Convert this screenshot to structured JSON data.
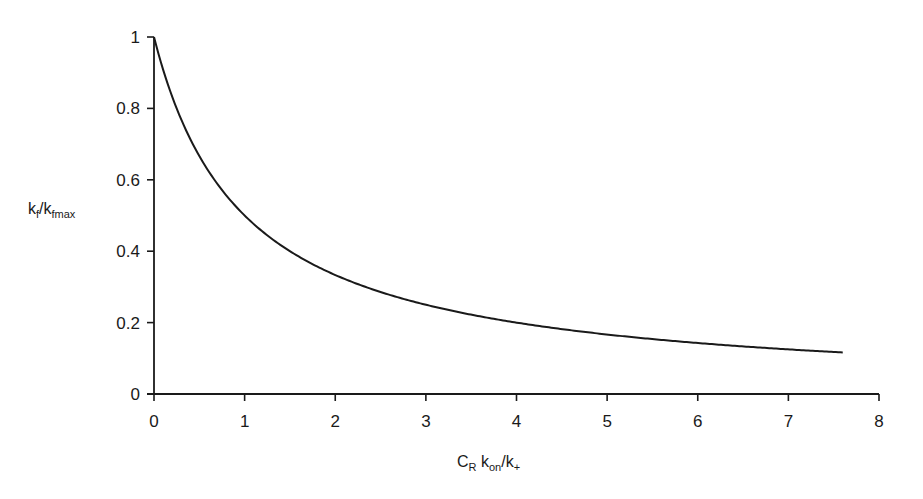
{
  "chart_data": {
    "type": "line",
    "title": "",
    "xlabel": "C_R k_on/k_+",
    "ylabel": "k_f/k_fmax",
    "xlim": [
      0,
      8
    ],
    "ylim": [
      0,
      1
    ],
    "x_ticks": [
      "0",
      "1",
      "2",
      "3",
      "4",
      "5",
      "6",
      "7",
      "8"
    ],
    "y_ticks": [
      "0",
      "0.2",
      "0.4",
      "0.6",
      "0.8",
      "1"
    ],
    "grid": false,
    "legend": null,
    "series": [
      {
        "name": "k_f/k_fmax",
        "function": "1/(1+x)",
        "x": [
          0,
          0.25,
          0.5,
          0.75,
          1,
          1.5,
          2,
          2.5,
          3,
          3.5,
          4,
          4.5,
          5,
          5.5,
          6,
          6.5,
          7,
          7.6
        ],
        "values": [
          1.0,
          0.8,
          0.667,
          0.571,
          0.5,
          0.4,
          0.333,
          0.286,
          0.25,
          0.222,
          0.2,
          0.182,
          0.167,
          0.154,
          0.143,
          0.133,
          0.125,
          0.116
        ]
      }
    ],
    "line_color": "#1a1a1a"
  },
  "labels": {
    "y_main": "k",
    "y_sub1": "f",
    "y_mid": "/k",
    "y_sub2": "fmax",
    "x_c": "C",
    "x_sub_r": "R",
    "x_k": " k",
    "x_sub_on": "on",
    "x_mid": "/k",
    "x_sub_plus": "+"
  }
}
